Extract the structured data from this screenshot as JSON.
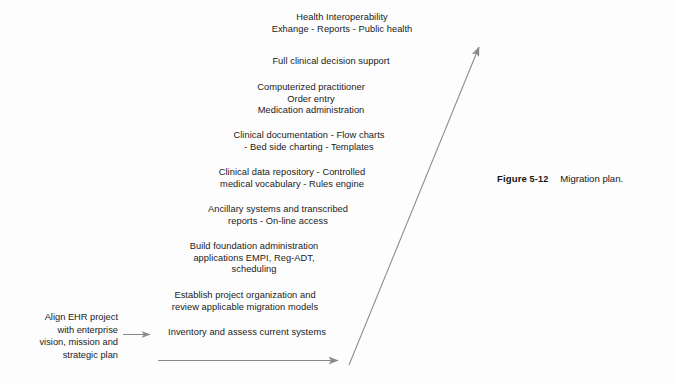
{
  "figure": {
    "caption_label": "Figure",
    "caption_number": "5-12",
    "caption_text": "Migration plan.",
    "line_color": "#8a8a8a",
    "text_color": "#1a1a1a",
    "background_color": "#fdfdfd"
  },
  "origin": {
    "text": "Align EHR project\nwith enterprise\nvision, mission and\nstrategic plan"
  },
  "steps": [
    {
      "id": "health-interoperability",
      "text": "Health Interoperability\nExhange - Reports - Public health"
    },
    {
      "id": "full-clinical-decision-support",
      "text": "Full clinical decision support"
    },
    {
      "id": "computerized-practitioner-order-entry",
      "text": "Computerized practitioner\nOrder entry\nMedication administration"
    },
    {
      "id": "clinical-documentation",
      "text": "Clinical documentation - Flow charts\n- Bed side charting - Templates"
    },
    {
      "id": "clinical-data-repository",
      "text": "Clinical data repository - Controlled\nmedical vocabulary - Rules engine"
    },
    {
      "id": "ancillary-systems",
      "text": "Ancillary systems and transcribed\nreports - On-line access"
    },
    {
      "id": "build-foundation-administration",
      "text": "Build foundation administration\napplications EMPI, Reg-ADT,\nscheduling"
    },
    {
      "id": "establish-project-organization",
      "text": "Establish project organization and\nreview applicable migration models"
    },
    {
      "id": "inventory-and-assess",
      "text": "Inventory and assess current systems"
    }
  ],
  "arrows": [
    {
      "id": "origin-to-inventory-arrow",
      "type": "horizontal-short"
    },
    {
      "id": "baseline-timeline-arrow",
      "type": "horizontal-long"
    },
    {
      "id": "maturity-diagonal-arrow",
      "type": "diagonal-up-right"
    }
  ]
}
